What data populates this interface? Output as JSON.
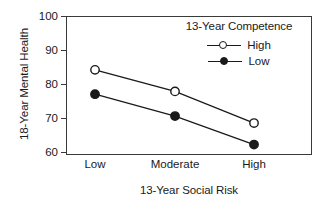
{
  "chart_data": {
    "type": "line",
    "title": "",
    "xlabel": "13-Year Social Risk",
    "ylabel": "18-Year Mental Health",
    "categories": [
      "Low",
      "Moderate",
      "High"
    ],
    "ylim": [
      60,
      100
    ],
    "yticks": [
      60,
      70,
      80,
      90,
      100
    ],
    "ytick_labels": [
      "60",
      "70",
      "80",
      "90",
      "100"
    ],
    "grid": false,
    "legend_position": "top-right-inside",
    "legend_title": "13-Year Competence",
    "series": [
      {
        "name": "High",
        "marker": "open-circle",
        "values": [
          84.5,
          78.3,
          69.2
        ]
      },
      {
        "name": "Low",
        "marker": "filled-circle",
        "values": [
          77.5,
          71.2,
          63.0
        ]
      }
    ]
  },
  "axes": {
    "y_title": "18-Year Mental Health",
    "x_title": "13-Year Social Risk",
    "y_ticks": [
      "100",
      "90",
      "80",
      "70",
      "60"
    ],
    "x_ticks": [
      "Low",
      "Moderate",
      "High"
    ]
  },
  "legend": {
    "title": "13-Year Competence",
    "items": [
      {
        "label": "High",
        "marker": "open-circle"
      },
      {
        "label": "Low",
        "marker": "filled-circle"
      }
    ]
  },
  "colors": {
    "ink": "#1a1a1a",
    "frame": "#3a3a3a",
    "background": "#ffffff"
  }
}
